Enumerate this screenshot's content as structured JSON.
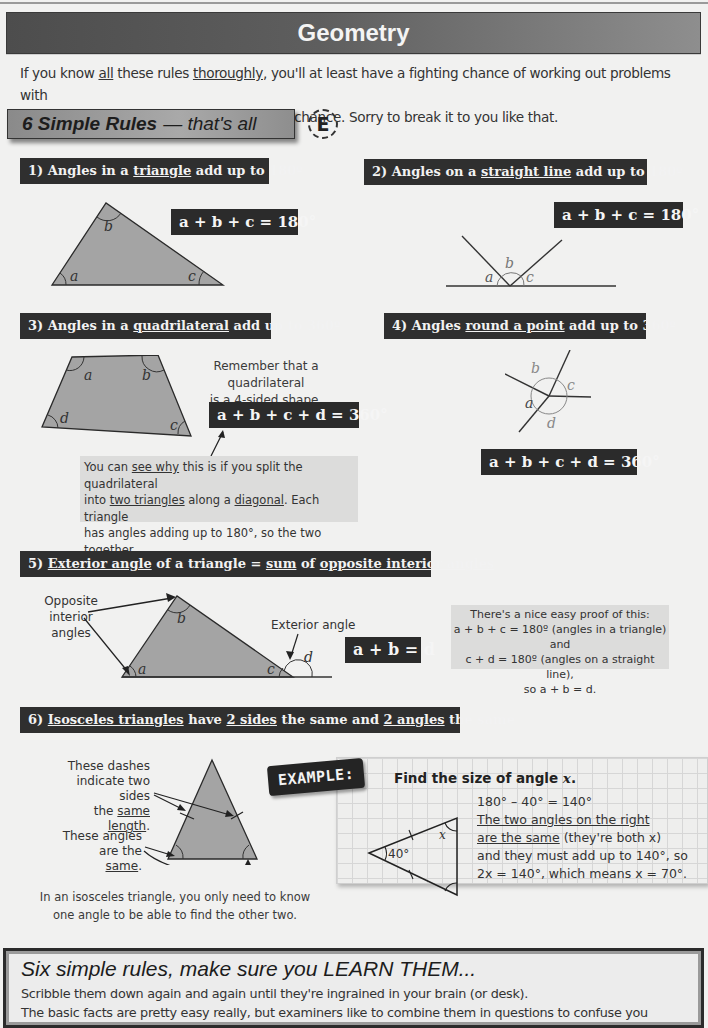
{
  "page": {
    "title": "Geometry",
    "intro": {
      "line1_parts": [
        "If you know ",
        "all",
        " these rules ",
        "thoroughly",
        ", you'll at least have a fighting chance of working out problems with"
      ],
      "line2": "lines and angles.  If you don't — you've no chance.  Sorry to break it to you like that."
    },
    "rules_banner": {
      "bold": "6 Simple Rules",
      "rest": "— that's all"
    },
    "badge_letter": "E"
  },
  "rules": [
    {
      "number": "1)",
      "title_parts": [
        "1) Angles in a ",
        "triangle",
        " add up to 180º"
      ],
      "formula": "a + b + c = 180°",
      "angle_labels": [
        "a",
        "b",
        "c"
      ]
    },
    {
      "number": "2)",
      "title_parts": [
        "2) Angles on a ",
        "straight line",
        " add up to 180º"
      ],
      "formula": "a + b + c = 180°",
      "angle_labels": [
        "a",
        "b",
        "c"
      ]
    },
    {
      "number": "3)",
      "title_parts": [
        "3) Angles in a ",
        "quadrilateral",
        " add up to 360º"
      ],
      "formula": "a + b + c + d = 360°",
      "angle_labels": [
        "a",
        "b",
        "c",
        "d"
      ],
      "note_lines": [
        "Remember that a quadrilateral",
        "is a 4-sided shape."
      ],
      "explanation": {
        "line1_parts": [
          "You can ",
          "see why",
          " this is if you split the quadrilateral"
        ],
        "line2_parts": [
          "into ",
          "two triangles",
          " along a ",
          "diagonal",
          ".  Each triangle"
        ],
        "line3": "has angles adding up to 180°, so the two together",
        "line4": "have angles adding up to 180° + 180° = 360°."
      }
    },
    {
      "number": "4)",
      "title_parts": [
        "4) Angles ",
        "round a point",
        " add up to 360º"
      ],
      "formula": "a + b + c + d = 360°",
      "angle_labels": [
        "a",
        "b",
        "c",
        "d"
      ]
    },
    {
      "number": "5)",
      "title_parts": [
        "5) ",
        "Exterior angle",
        " of a triangle = ",
        "sum",
        " of ",
        "opposite interior angles"
      ],
      "formula": "a + b = d",
      "angle_labels": [
        "a",
        "b",
        "c",
        "d"
      ],
      "label_opposite": [
        "Opposite",
        "interior angles"
      ],
      "label_exterior": "Exterior angle",
      "proof_lines": [
        "There's a nice easy proof of this:",
        "a + b + c = 180º (angles in a triangle) and",
        "c + d = 180º (angles on a straight line),",
        "so a + b = d."
      ]
    },
    {
      "number": "6)",
      "title_parts": [
        "6) ",
        "Isosceles triangles",
        " have ",
        "2 sides",
        " the same and ",
        "2 angles",
        " the same"
      ],
      "dash_label": {
        "line1": "These dashes",
        "line2": "indicate two sides",
        "line3_pre": "the ",
        "line3_u": "same length",
        "line3_post": "."
      },
      "angle_label": {
        "line1": "These angles",
        "line2_pre": "are the ",
        "line2_u": "same",
        "line2_post": "."
      },
      "note_lines": [
        "In an isosceles triangle, you only need to know",
        "one angle to be able to find the other two."
      ]
    }
  ],
  "example": {
    "badge": "EXAMPLE:",
    "question_pre": "Find the size of angle ",
    "question_var": "x",
    "question_post": ".",
    "given_angle": "40°",
    "unknown_label": "x",
    "lines": {
      "l1": "180° – 40° = 140°",
      "l2": "The two angles on the right",
      "l3_u": "are the same",
      "l3_rest": " (they're both x)",
      "l4": "and they must add up to 140°, so",
      "l5": "2x = 140°, which means x = 70°."
    }
  },
  "summary": {
    "title": "Six simple rules, make sure you LEARN THEM...",
    "line1": "Scribble them down again and again until they're ingrained in your brain (or desk).",
    "line2": "The basic facts are pretty easy really, but examiners like to combine them in questions to confuse you"
  },
  "colors": {
    "page_bg": "#f1f1f0",
    "title_bar": "#2f2f2f",
    "shape_fill": "#a4a4a4",
    "gray_box": "#dcdcdb"
  }
}
